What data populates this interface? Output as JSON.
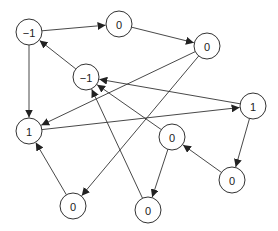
{
  "diagram": {
    "type": "directed-graph",
    "node_radius": 13,
    "stroke_color": "#333333",
    "background": "#ffffff",
    "nodes": [
      {
        "id": "A",
        "label": "−1",
        "x": 29,
        "y": 32
      },
      {
        "id": "B",
        "label": "0",
        "x": 119,
        "y": 24
      },
      {
        "id": "C",
        "label": "0",
        "x": 207,
        "y": 46
      },
      {
        "id": "D",
        "label": "−1",
        "x": 86,
        "y": 77
      },
      {
        "id": "E",
        "label": "1",
        "x": 29,
        "y": 131
      },
      {
        "id": "F",
        "label": "1",
        "x": 253,
        "y": 106
      },
      {
        "id": "G",
        "label": "0",
        "x": 172,
        "y": 137
      },
      {
        "id": "H",
        "label": "0",
        "x": 232,
        "y": 180
      },
      {
        "id": "I",
        "label": "0",
        "x": 73,
        "y": 206
      },
      {
        "id": "J",
        "label": "0",
        "x": 148,
        "y": 210
      }
    ],
    "edges": [
      {
        "from": "A",
        "to": "B"
      },
      {
        "from": "B",
        "to": "C"
      },
      {
        "from": "A",
        "to": "E"
      },
      {
        "from": "D",
        "to": "A"
      },
      {
        "from": "F",
        "to": "D"
      },
      {
        "from": "G",
        "to": "D"
      },
      {
        "from": "J",
        "to": "D"
      },
      {
        "from": "C",
        "to": "E"
      },
      {
        "from": "C",
        "to": "I"
      },
      {
        "from": "E",
        "to": "F"
      },
      {
        "from": "I",
        "to": "E"
      },
      {
        "from": "F",
        "to": "H"
      },
      {
        "from": "H",
        "to": "G"
      },
      {
        "from": "G",
        "to": "J"
      }
    ]
  }
}
